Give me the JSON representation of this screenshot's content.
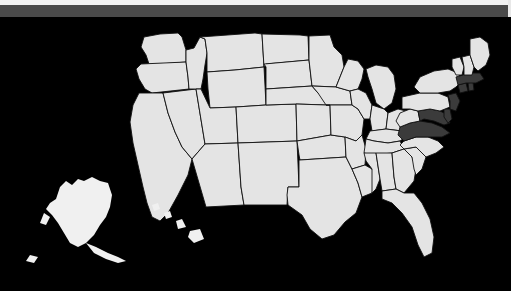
{
  "window": {
    "title": "United States Map",
    "top_bar_color": "#4a4a4a",
    "background_color": "#000000"
  },
  "map": {
    "name": "united-states-choropleth",
    "projection": "albers-usa",
    "base_state_fill": "#e4e4e4",
    "highlight_state_fill": "#3b3b3b",
    "border_color": "#111111",
    "ocean_color": "#000000",
    "legend": {
      "highlighted_label": "Selected",
      "default_label": "Not selected"
    },
    "highlighted_states": [
      "Virginia",
      "Maryland",
      "Delaware",
      "New Jersey",
      "Massachusetts",
      "Rhode Island",
      "Connecticut"
    ],
    "states": [
      {
        "code": "WA",
        "name": "Washington",
        "highlighted": false
      },
      {
        "code": "OR",
        "name": "Oregon",
        "highlighted": false
      },
      {
        "code": "CA",
        "name": "California",
        "highlighted": false
      },
      {
        "code": "NV",
        "name": "Nevada",
        "highlighted": false
      },
      {
        "code": "ID",
        "name": "Idaho",
        "highlighted": false
      },
      {
        "code": "MT",
        "name": "Montana",
        "highlighted": false
      },
      {
        "code": "WY",
        "name": "Wyoming",
        "highlighted": false
      },
      {
        "code": "UT",
        "name": "Utah",
        "highlighted": false
      },
      {
        "code": "AZ",
        "name": "Arizona",
        "highlighted": false
      },
      {
        "code": "CO",
        "name": "Colorado",
        "highlighted": false
      },
      {
        "code": "NM",
        "name": "New Mexico",
        "highlighted": false
      },
      {
        "code": "ND",
        "name": "North Dakota",
        "highlighted": false
      },
      {
        "code": "SD",
        "name": "South Dakota",
        "highlighted": false
      },
      {
        "code": "NE",
        "name": "Nebraska",
        "highlighted": false
      },
      {
        "code": "KS",
        "name": "Kansas",
        "highlighted": false
      },
      {
        "code": "OK",
        "name": "Oklahoma",
        "highlighted": false
      },
      {
        "code": "TX",
        "name": "Texas",
        "highlighted": false
      },
      {
        "code": "MN",
        "name": "Minnesota",
        "highlighted": false
      },
      {
        "code": "IA",
        "name": "Iowa",
        "highlighted": false
      },
      {
        "code": "MO",
        "name": "Missouri",
        "highlighted": false
      },
      {
        "code": "AR",
        "name": "Arkansas",
        "highlighted": false
      },
      {
        "code": "LA",
        "name": "Louisiana",
        "highlighted": false
      },
      {
        "code": "WI",
        "name": "Wisconsin",
        "highlighted": false
      },
      {
        "code": "IL",
        "name": "Illinois",
        "highlighted": false
      },
      {
        "code": "MI",
        "name": "Michigan",
        "highlighted": false
      },
      {
        "code": "IN",
        "name": "Indiana",
        "highlighted": false
      },
      {
        "code": "OH",
        "name": "Ohio",
        "highlighted": false
      },
      {
        "code": "KY",
        "name": "Kentucky",
        "highlighted": false
      },
      {
        "code": "TN",
        "name": "Tennessee",
        "highlighted": false
      },
      {
        "code": "MS",
        "name": "Mississippi",
        "highlighted": false
      },
      {
        "code": "AL",
        "name": "Alabama",
        "highlighted": false
      },
      {
        "code": "GA",
        "name": "Georgia",
        "highlighted": false
      },
      {
        "code": "FL",
        "name": "Florida",
        "highlighted": false
      },
      {
        "code": "SC",
        "name": "South Carolina",
        "highlighted": false
      },
      {
        "code": "NC",
        "name": "North Carolina",
        "highlighted": false
      },
      {
        "code": "VA",
        "name": "Virginia",
        "highlighted": true
      },
      {
        "code": "WV",
        "name": "West Virginia",
        "highlighted": false
      },
      {
        "code": "MD",
        "name": "Maryland",
        "highlighted": true
      },
      {
        "code": "DE",
        "name": "Delaware",
        "highlighted": true
      },
      {
        "code": "PA",
        "name": "Pennsylvania",
        "highlighted": false
      },
      {
        "code": "NJ",
        "name": "New Jersey",
        "highlighted": true
      },
      {
        "code": "NY",
        "name": "New York",
        "highlighted": false
      },
      {
        "code": "CT",
        "name": "Connecticut",
        "highlighted": true
      },
      {
        "code": "RI",
        "name": "Rhode Island",
        "highlighted": true
      },
      {
        "code": "MA",
        "name": "Massachusetts",
        "highlighted": true
      },
      {
        "code": "VT",
        "name": "Vermont",
        "highlighted": false
      },
      {
        "code": "NH",
        "name": "New Hampshire",
        "highlighted": false
      },
      {
        "code": "ME",
        "name": "Maine",
        "highlighted": false
      },
      {
        "code": "AK",
        "name": "Alaska",
        "highlighted": false
      },
      {
        "code": "HI",
        "name": "Hawaii",
        "highlighted": false
      }
    ]
  }
}
